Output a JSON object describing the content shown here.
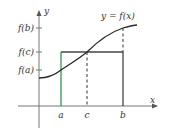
{
  "diagram": {
    "curve_label": "y = f(x)",
    "axis_x_label": "x",
    "axis_y_label": "y",
    "y_ticks": [
      {
        "id": "fb",
        "label": "f(b)"
      },
      {
        "id": "fc",
        "label": "f(c)"
      },
      {
        "id": "fa",
        "label": "f(a)"
      }
    ],
    "x_ticks": [
      {
        "id": "a",
        "label": "a"
      },
      {
        "id": "c",
        "label": "c"
      },
      {
        "id": "b",
        "label": "b"
      }
    ],
    "colors": {
      "axis": "#777777",
      "curve": "#2a2a2a",
      "rectangle": "#444444",
      "left_side": "#2e9a4a",
      "dashed": "#333333"
    }
  }
}
